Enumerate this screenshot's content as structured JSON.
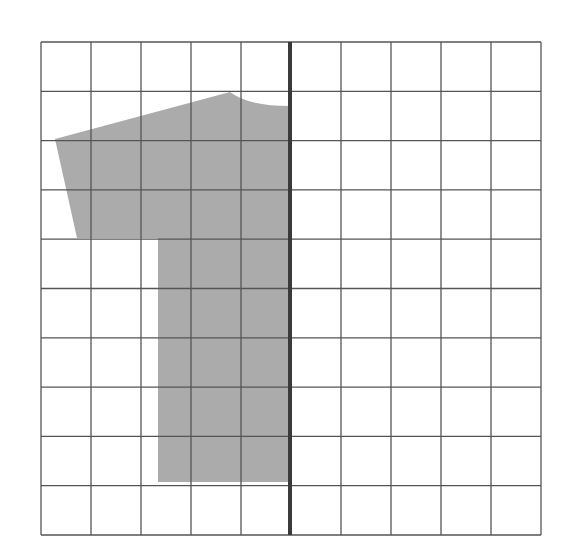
{
  "diagram": {
    "type": "grid-with-shape",
    "grid": {
      "columns": 10,
      "rows": 10,
      "left": 41,
      "top": 42,
      "width": 500,
      "height": 493,
      "line_color": "#555555"
    },
    "axis_line": {
      "description": "thick vertical line of symmetry",
      "column_index": 5,
      "x": 290,
      "color": "#3a3a3a",
      "width": 4
    },
    "shape": {
      "description": "gray shaded half-figure (left half of a T-shirt/shape) to the left of the line of symmetry",
      "fill": "#ababab",
      "points": [
        [
          55,
          139
        ],
        [
          230,
          92
        ],
        [
          290,
          106
        ],
        [
          290,
          482
        ],
        [
          158,
          482
        ],
        [
          158,
          238
        ],
        [
          77,
          238
        ]
      ]
    }
  }
}
